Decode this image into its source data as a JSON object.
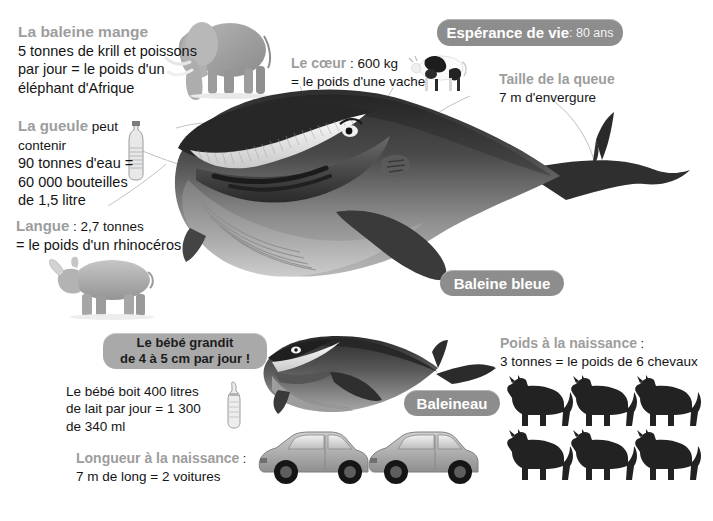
{
  "poster": {
    "subject": "Baleine bleue",
    "language": "fr",
    "background_color": "#ffffff",
    "accent_gray": "#9d9d9d",
    "badge_gray": "#8d8d8d",
    "text_color": "#141414"
  },
  "facts": {
    "feeding": {
      "title": "La baleine mange",
      "lines": [
        "5 tonnes de krill et poissons",
        "par jour = le poids d'un",
        "éléphant d'Afrique"
      ],
      "icon": "elephant-illustration"
    },
    "heart": {
      "title": "Le cœur",
      "title_tail": " : 600 kg",
      "lines": [
        "= le poids d'une vache"
      ],
      "icon": "cow-illustration"
    },
    "tail": {
      "title": "Taille de la queue",
      "lines": [
        "7 m d'envergure"
      ]
    },
    "mouth": {
      "title": "La gueule",
      "title_tail": " peut contenir",
      "lines": [
        "90 tonnes d'eau =",
        "60 000 bouteilles",
        "de 1,5 litre"
      ],
      "icon": "water-bottle-icon"
    },
    "tongue": {
      "title": "Langue",
      "title_tail": " : 2,7 tonnes",
      "lines": [
        "= le poids d'un rhinocéros"
      ],
      "icon": "rhinoceros-illustration"
    },
    "baby_growth": {
      "lines": [
        "Le bébé grandit",
        "de 4 à 5 cm par jour !"
      ]
    },
    "baby_milk": {
      "lines": [
        "Le bébé boit 400 litres",
        "de lait par jour = 1 300",
        "de 340 ml"
      ],
      "icon": "baby-bottle-icon"
    },
    "birth_length": {
      "title": "Longueur à la naissance",
      "title_tail": " :",
      "lines": [
        "7 m de long = 2 voitures"
      ],
      "icon": "car-illustration",
      "icon_count": 2
    },
    "birth_weight": {
      "title": "Poids à la naissance",
      "title_tail": " :",
      "lines": [
        "3 tonnes = le poids de 6 chevaux"
      ],
      "icon": "horse-silhouette",
      "icon_count": 6
    }
  },
  "badges": {
    "lifespan": {
      "label": "Espérance de vie",
      "value": " : 80 ans"
    },
    "adult_name": {
      "label": "Baleine bleue"
    },
    "calf_name": {
      "label": "Baleineau"
    }
  }
}
